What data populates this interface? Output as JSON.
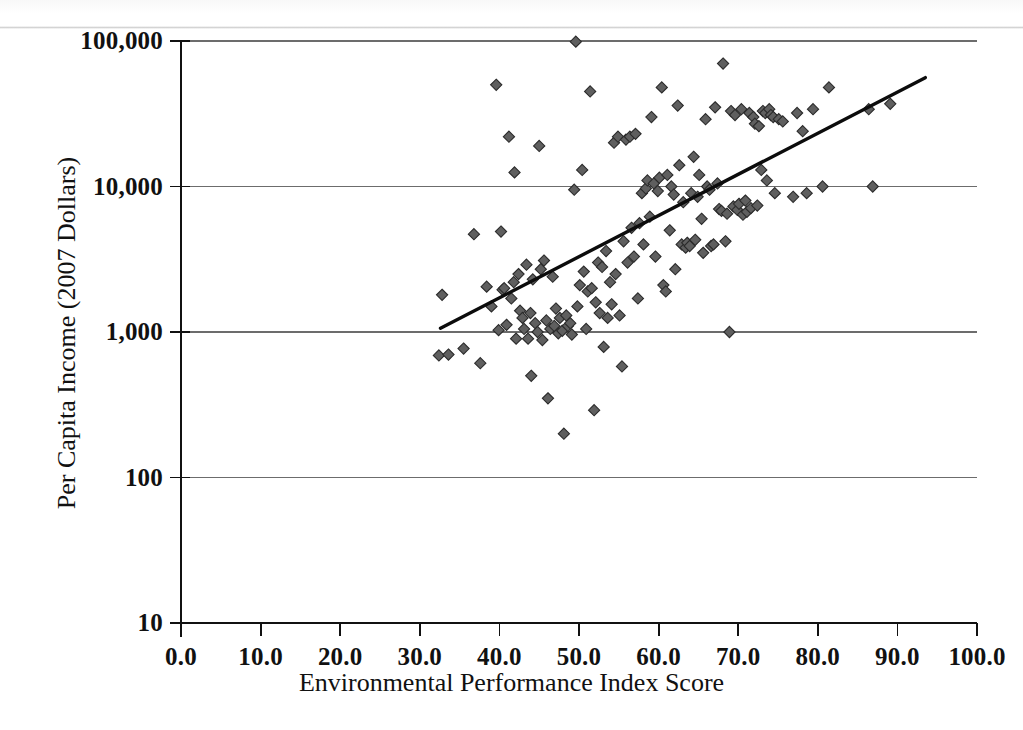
{
  "figure": {
    "background_color": "#ffffff",
    "marker_color": "#5f5f5f",
    "marker_edge_color": "#2b2b2b",
    "trendline_color": "#0c0c0c",
    "gridline_color": "#6c6c6c",
    "axis_color": "#111111"
  },
  "chart_data": {
    "type": "scatter",
    "title": "",
    "xlabel": "Environmental Performance Index Score",
    "ylabel": "Per Capita Income (2007 Dollars)",
    "xlim": [
      0.0,
      100.0
    ],
    "ylim": [
      10,
      100000
    ],
    "yscale": "log",
    "xscale": "linear",
    "grid": "horizontal",
    "legend": "none",
    "xticks": [
      0.0,
      10.0,
      20.0,
      30.0,
      40.0,
      50.0,
      60.0,
      70.0,
      80.0,
      90.0,
      100.0
    ],
    "xtick_labels": [
      "0.0",
      "10.0",
      "20.0",
      "30.0",
      "40.0",
      "50.0",
      "60.0",
      "70.0",
      "80.0",
      "90.0",
      "100.0"
    ],
    "yticks": [
      10,
      100,
      1000,
      10000,
      100000
    ],
    "ytick_labels": [
      "10",
      "100",
      "1,000",
      "10,000",
      "100,000"
    ],
    "trendline": {
      "type": "linear-on-log-y",
      "x_start": 32.6,
      "y_start": 1060,
      "x_end": 93.5,
      "y_end": 56000
    },
    "points": [
      [
        32.4,
        690
      ],
      [
        33.6,
        700
      ],
      [
        32.8,
        1800
      ],
      [
        35.5,
        770
      ],
      [
        36.8,
        4700
      ],
      [
        37.6,
        610
      ],
      [
        38.4,
        2050
      ],
      [
        39.0,
        1500
      ],
      [
        39.6,
        50000
      ],
      [
        39.9,
        1030
      ],
      [
        40.2,
        4900
      ],
      [
        40.4,
        1950
      ],
      [
        40.6,
        2000
      ],
      [
        40.9,
        1120
      ],
      [
        41.2,
        22000
      ],
      [
        41.5,
        1700
      ],
      [
        41.8,
        2200
      ],
      [
        41.9,
        12500
      ],
      [
        42.1,
        900
      ],
      [
        42.4,
        2500
      ],
      [
        42.6,
        1400
      ],
      [
        42.9,
        1250
      ],
      [
        43.1,
        1050
      ],
      [
        43.4,
        2900
      ],
      [
        43.6,
        900
      ],
      [
        43.9,
        1350
      ],
      [
        44.0,
        500
      ],
      [
        44.2,
        2300
      ],
      [
        44.5,
        1150
      ],
      [
        44.8,
        1000
      ],
      [
        45.0,
        19000
      ],
      [
        45.2,
        2700
      ],
      [
        45.4,
        880
      ],
      [
        45.6,
        3100
      ],
      [
        45.9,
        1200
      ],
      [
        46.1,
        350
      ],
      [
        46.4,
        1050
      ],
      [
        46.7,
        2400
      ],
      [
        46.9,
        1100
      ],
      [
        47.1,
        1450
      ],
      [
        47.4,
        980
      ],
      [
        47.6,
        1250
      ],
      [
        47.9,
        1020
      ],
      [
        48.1,
        200
      ],
      [
        48.4,
        1300
      ],
      [
        48.6,
        1100
      ],
      [
        48.9,
        1150
      ],
      [
        49.1,
        960
      ],
      [
        49.4,
        9500
      ],
      [
        49.6,
        99000
      ],
      [
        49.8,
        1500
      ],
      [
        50.1,
        2100
      ],
      [
        50.4,
        13000
      ],
      [
        50.6,
        2600
      ],
      [
        50.9,
        1050
      ],
      [
        51.1,
        1900
      ],
      [
        51.4,
        45000
      ],
      [
        51.6,
        2000
      ],
      [
        51.9,
        290
      ],
      [
        52.1,
        1600
      ],
      [
        52.4,
        3000
      ],
      [
        52.6,
        1350
      ],
      [
        52.9,
        2800
      ],
      [
        53.1,
        790
      ],
      [
        53.4,
        3600
      ],
      [
        53.6,
        1250
      ],
      [
        53.9,
        2200
      ],
      [
        54.1,
        1550
      ],
      [
        54.4,
        20000
      ],
      [
        54.6,
        2500
      ],
      [
        54.9,
        22000
      ],
      [
        55.1,
        1300
      ],
      [
        55.4,
        580
      ],
      [
        55.6,
        4200
      ],
      [
        55.9,
        21000
      ],
      [
        56.1,
        3000
      ],
      [
        56.4,
        22000
      ],
      [
        56.6,
        5200
      ],
      [
        56.9,
        3300
      ],
      [
        57.1,
        23000
      ],
      [
        57.4,
        1700
      ],
      [
        57.6,
        5600
      ],
      [
        57.9,
        9000
      ],
      [
        58.1,
        4000
      ],
      [
        58.4,
        9700
      ],
      [
        58.6,
        11000
      ],
      [
        58.9,
        6200
      ],
      [
        59.1,
        30000
      ],
      [
        59.4,
        10500
      ],
      [
        59.6,
        3300
      ],
      [
        59.9,
        9300
      ],
      [
        60.1,
        11500
      ],
      [
        60.4,
        48000
      ],
      [
        60.6,
        2100
      ],
      [
        60.9,
        1900
      ],
      [
        61.1,
        12000
      ],
      [
        61.4,
        5000
      ],
      [
        61.6,
        10000
      ],
      [
        61.9,
        8800
      ],
      [
        62.1,
        2700
      ],
      [
        62.4,
        36000
      ],
      [
        62.6,
        14000
      ],
      [
        62.9,
        4000
      ],
      [
        63.1,
        7800
      ],
      [
        63.4,
        3800
      ],
      [
        63.6,
        4100
      ],
      [
        63.9,
        3900
      ],
      [
        64.1,
        9000
      ],
      [
        64.4,
        16000
      ],
      [
        64.6,
        4300
      ],
      [
        64.9,
        8500
      ],
      [
        65.1,
        12000
      ],
      [
        65.4,
        6000
      ],
      [
        65.6,
        3500
      ],
      [
        65.9,
        29000
      ],
      [
        66.1,
        10000
      ],
      [
        66.4,
        9500
      ],
      [
        66.6,
        3900
      ],
      [
        66.9,
        4000
      ],
      [
        67.1,
        35000
      ],
      [
        67.4,
        10500
      ],
      [
        67.6,
        7000
      ],
      [
        67.9,
        6800
      ],
      [
        68.1,
        70000
      ],
      [
        68.4,
        4200
      ],
      [
        68.6,
        6500
      ],
      [
        68.9,
        1000
      ],
      [
        69.1,
        33000
      ],
      [
        69.4,
        7300
      ],
      [
        69.6,
        31000
      ],
      [
        69.9,
        6900
      ],
      [
        70.1,
        7600
      ],
      [
        70.4,
        34000
      ],
      [
        70.6,
        6400
      ],
      [
        70.9,
        8000
      ],
      [
        71.1,
        6700
      ],
      [
        71.4,
        32000
      ],
      [
        71.6,
        7100
      ],
      [
        71.9,
        30000
      ],
      [
        72.1,
        27000
      ],
      [
        72.4,
        7400
      ],
      [
        72.6,
        26000
      ],
      [
        72.9,
        13000
      ],
      [
        73.1,
        33000
      ],
      [
        73.4,
        32000
      ],
      [
        73.6,
        11000
      ],
      [
        73.9,
        34000
      ],
      [
        74.1,
        31000
      ],
      [
        74.4,
        30000
      ],
      [
        74.6,
        9000
      ],
      [
        75.1,
        29000
      ],
      [
        75.6,
        28000
      ],
      [
        76.9,
        8500
      ],
      [
        77.4,
        32000
      ],
      [
        78.1,
        24000
      ],
      [
        78.6,
        9000
      ],
      [
        79.4,
        34000
      ],
      [
        80.6,
        10000
      ],
      [
        81.4,
        48000
      ],
      [
        86.4,
        34000
      ],
      [
        86.9,
        10000
      ],
      [
        89.1,
        37000
      ]
    ]
  },
  "axis_labels": {
    "x_title": "Environmental Performance Index Score",
    "y_title": "Per Capita Income (2007 Dollars)"
  }
}
